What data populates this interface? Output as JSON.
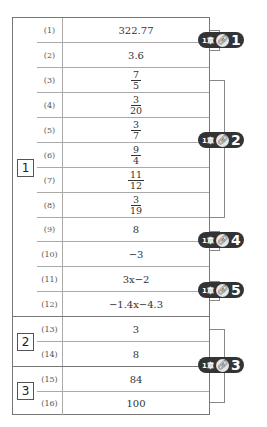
{
  "sections": [
    {
      "label": "1",
      "rows": [
        1,
        2,
        3,
        4,
        5,
        6,
        7,
        8,
        9,
        10,
        11,
        12
      ]
    },
    {
      "label": "2",
      "rows": [
        13,
        14
      ]
    },
    {
      "label": "3",
      "rows": [
        15,
        16
      ]
    }
  ],
  "rows": [
    {
      "num": "(1)",
      "answer": "322.77"
    },
    {
      "num": "(2)",
      "answer": "3.6"
    },
    {
      "num": "(3)",
      "numerator": "7",
      "denominator": "5"
    },
    {
      "num": "(4)",
      "numerator": "3",
      "denominator": "20"
    },
    {
      "num": "(5)",
      "numerator": "3",
      "denominator": "7"
    },
    {
      "num": "(6)",
      "numerator": "9",
      "denominator": "4"
    },
    {
      "num": "(7)",
      "numerator": "11",
      "denominator": "12"
    },
    {
      "num": "(8)",
      "numerator": "3",
      "denominator": "19"
    },
    {
      "num": "(9)",
      "answer": "8"
    },
    {
      "num": "(10)",
      "answer": "−3"
    },
    {
      "num": "(11)",
      "answer": "3x−2"
    },
    {
      "num": "(12)",
      "answer": "−1.4x−4.3"
    },
    {
      "num": "(13)",
      "answer": "3"
    },
    {
      "num": "(14)",
      "answer": "8"
    },
    {
      "num": "(15)",
      "answer": "84"
    },
    {
      "num": "(16)",
      "answer": "100"
    }
  ],
  "badges": [
    {
      "chapter": "1章",
      "icon": "link-icon",
      "number": "1",
      "rows": "(1)-(2)"
    },
    {
      "chapter": "1章",
      "icon": "link-icon",
      "number": "2",
      "rows": "(3)-(8)"
    },
    {
      "chapter": "1章",
      "icon": "link-icon",
      "number": "4",
      "rows": "(9)-(10)"
    },
    {
      "chapter": "1章",
      "icon": "link-icon",
      "number": "5",
      "rows": "(11)-(12)"
    },
    {
      "chapter": "1章",
      "icon": "link-icon",
      "number": "3",
      "rows": "(13)-(16)"
    }
  ],
  "colors": {
    "border": "#777777",
    "badge_bg": "#333333",
    "text": "#333333"
  }
}
